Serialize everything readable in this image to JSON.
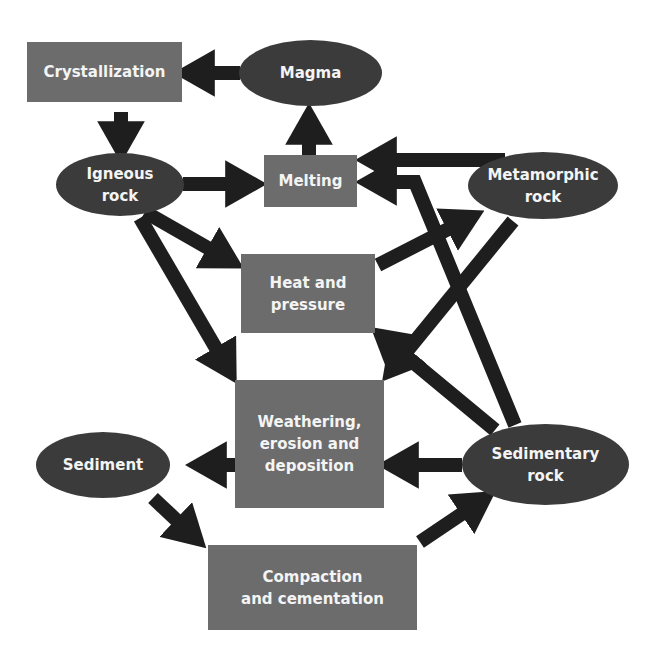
{
  "diagram": {
    "type": "rock-cycle flowchart",
    "colors": {
      "process_box": "#6c6c6c",
      "rock_ellipse": "#3b3b3b",
      "arrow": "#1e1e1e",
      "text": "#f4f4f4",
      "background": "#ffffff"
    },
    "nodes": {
      "crystallization": {
        "label": "Crystallization",
        "shape": "box"
      },
      "magma": {
        "label": "Magma",
        "shape": "ellipse"
      },
      "igneous_rock": {
        "label": "Igneous\nrock",
        "shape": "ellipse"
      },
      "melting": {
        "label": "Melting",
        "shape": "box"
      },
      "metamorphic_rock": {
        "label": "Metamorphic\nrock",
        "shape": "ellipse"
      },
      "heat_and_pressure": {
        "label": "Heat and\npressure",
        "shape": "box"
      },
      "weathering": {
        "label": "Weathering,\nerosion and\ndeposition",
        "shape": "box"
      },
      "sediment": {
        "label": "Sediment",
        "shape": "ellipse"
      },
      "sedimentary_rock": {
        "label": "Sedimentary\nrock",
        "shape": "ellipse"
      },
      "compaction": {
        "label": "Compaction\nand cementation",
        "shape": "box"
      }
    },
    "edges": [
      {
        "from": "Magma",
        "to": "Crystallization"
      },
      {
        "from": "Crystallization",
        "to": "Igneous rock"
      },
      {
        "from": "Igneous rock",
        "to": "Melting"
      },
      {
        "from": "Melting",
        "to": "Magma"
      },
      {
        "from": "Metamorphic rock",
        "to": "Melting"
      },
      {
        "from": "Sedimentary rock",
        "to": "Melting"
      },
      {
        "from": "Igneous rock",
        "to": "Heat and pressure"
      },
      {
        "from": "Igneous rock",
        "to": "Weathering, erosion and deposition"
      },
      {
        "from": "Heat and pressure",
        "to": "Metamorphic rock"
      },
      {
        "from": "Metamorphic rock",
        "to": "Weathering, erosion and deposition"
      },
      {
        "from": "Sedimentary rock",
        "to": "Heat and pressure"
      },
      {
        "from": "Sedimentary rock",
        "to": "Weathering, erosion and deposition"
      },
      {
        "from": "Weathering, erosion and deposition",
        "to": "Sediment"
      },
      {
        "from": "Sediment",
        "to": "Compaction and cementation"
      },
      {
        "from": "Compaction and cementation",
        "to": "Sedimentary rock"
      }
    ]
  }
}
